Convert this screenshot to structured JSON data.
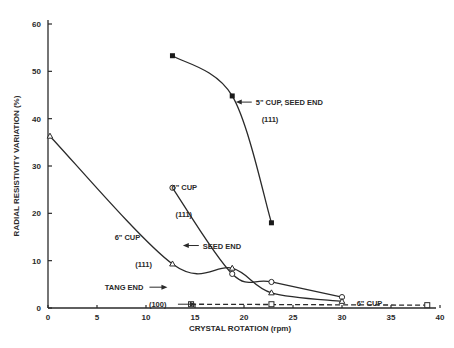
{
  "chart_data": {
    "type": "line",
    "title": "",
    "xlabel": "CRYSTAL ROTATION (rpm)",
    "ylabel": "RADIAL RESISTIVITY VARIATION (%)",
    "xlim": [
      0,
      40
    ],
    "ylim": [
      0,
      60
    ],
    "x_ticks": [
      0,
      5,
      10,
      15,
      20,
      25,
      30,
      35,
      40
    ],
    "y_ticks": [
      0,
      10,
      20,
      30,
      40,
      50,
      60
    ],
    "grid": false,
    "legend": "none (inline annotations)",
    "series": [
      {
        "name": "5\" CUP, SEED END (111)",
        "marker": "filled-square",
        "line": "solid",
        "x": [
          12.7,
          18.8,
          22.8
        ],
        "y": [
          53.3,
          44.8,
          18.0
        ]
      },
      {
        "name": "6\" CUP SEED END (111)",
        "marker": "open-circle",
        "line": "solid",
        "x": [
          12.7,
          18.8,
          22.8,
          30.0
        ],
        "y": [
          25.4,
          7.2,
          5.5,
          2.3
        ]
      },
      {
        "name": "6\" CUP TANG END (111)",
        "marker": "open-triangle",
        "line": "solid",
        "x": [
          0.2,
          12.7,
          18.8,
          22.8,
          30.0
        ],
        "y": [
          36.3,
          9.3,
          8.4,
          3.2,
          1.4
        ]
      },
      {
        "name": "6\" CUP (100)",
        "marker": "open-square",
        "line": "dashed",
        "x": [
          14.6,
          22.8,
          38.7
        ],
        "y": [
          0.8,
          0.8,
          0.6
        ]
      }
    ],
    "annotations": [
      {
        "text": "5\" CUP, SEED END",
        "x": 21.2,
        "y": 43.5,
        "arrow": true
      },
      {
        "text": "(111)",
        "x": 21.8,
        "y": 40.0
      },
      {
        "text": "6\" CUP",
        "x": 12.6,
        "y": 25.6
      },
      {
        "text": "(111)",
        "x": 13.0,
        "y": 19.9
      },
      {
        "text": "SEED END",
        "x": 15.8,
        "y": 13.2,
        "arrow": true
      },
      {
        "text": "6\" CUP",
        "x": 6.8,
        "y": 15.0
      },
      {
        "text": "(111)",
        "x": 8.9,
        "y": 9.2
      },
      {
        "text": "TANG END",
        "x": 5.8,
        "y": 4.4,
        "arrow": true
      },
      {
        "text": "(100)",
        "x": 10.3,
        "y": 0.8,
        "arrow": true
      },
      {
        "text": "6\" CUP",
        "x": 31.5,
        "y": 1.0
      }
    ]
  }
}
